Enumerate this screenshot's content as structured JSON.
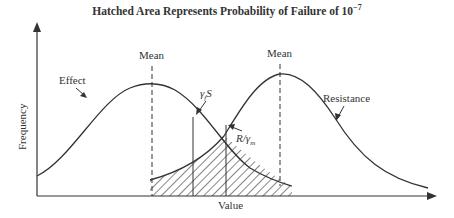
{
  "title": "Hatched Area Represents Probability of Failure of 10",
  "title_exponent": "−7",
  "axes": {
    "xlabel": "Value",
    "ylabel": "Frequency"
  },
  "labels": {
    "mean_left": "Mean",
    "mean_right": "Mean",
    "effect": "Effect",
    "resistance": "Resistance",
    "gamma_s": "γ",
    "gamma_s_sub": "f",
    "gamma_s_tail": "S",
    "r_over_gamma": "R/γ",
    "r_over_gamma_sub": "m"
  },
  "colors": {
    "line": "#333333",
    "background": "#ffffff"
  }
}
